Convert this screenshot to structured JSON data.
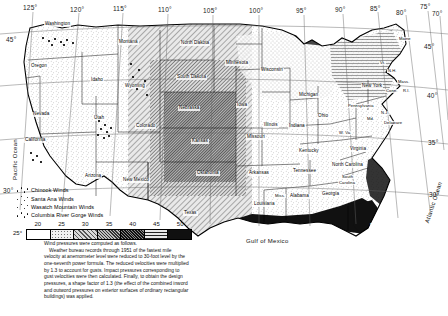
{
  "map": {
    "title": "United States wind pressure map",
    "oceans": [
      {
        "name": "Pacific Ocean",
        "x": 10,
        "y": 175,
        "rot": "vert"
      },
      {
        "name": "Atlantic Ocean",
        "x": 420,
        "y": 215,
        "rot": "vert2"
      },
      {
        "name": "Gulf of Mexico",
        "x": 248,
        "y": 240,
        "rot": "none"
      }
    ],
    "longitude_labels": [
      {
        "label": "125°",
        "x": 23,
        "y": 4
      },
      {
        "label": "120°",
        "x": 70,
        "y": 6
      },
      {
        "label": "115°",
        "x": 113,
        "y": 5
      },
      {
        "label": "110°",
        "x": 158,
        "y": 6
      },
      {
        "label": "105°",
        "x": 203,
        "y": 7
      },
      {
        "label": "100°",
        "x": 249,
        "y": 7
      },
      {
        "label": "95°",
        "x": 296,
        "y": 7
      },
      {
        "label": "90°",
        "x": 335,
        "y": 6
      },
      {
        "label": "85°",
        "x": 370,
        "y": 5
      },
      {
        "label": "80°",
        "x": 398,
        "y": 8
      },
      {
        "label": "75°",
        "x": 423,
        "y": 4
      },
      {
        "label": "70°",
        "x": 437,
        "y": 8
      },
      {
        "label": "65°",
        "x": 428,
        "y": 14
      }
    ],
    "latitude_labels_left": [
      {
        "label": "45°",
        "x": 6,
        "y": 37
      },
      {
        "label": "30°",
        "x": 3,
        "y": 188
      }
    ],
    "latitude_labels_right": [
      {
        "label": "45°",
        "x": 424,
        "y": 44
      },
      {
        "label": "40°",
        "x": 427,
        "y": 93
      },
      {
        "label": "35°",
        "x": 429,
        "y": 140
      },
      {
        "label": "30°",
        "x": 430,
        "y": 192
      }
    ],
    "states": [
      {
        "name": "Washington",
        "x": 44,
        "y": 24,
        "size": "sm"
      },
      {
        "name": "Oregon",
        "x": 30,
        "y": 66,
        "size": "sm"
      },
      {
        "name": "Idaho",
        "x": 90,
        "y": 79,
        "size": "sm"
      },
      {
        "name": "Montana",
        "x": 118,
        "y": 41,
        "size": "sm"
      },
      {
        "name": "Nevada",
        "x": 34,
        "y": 113,
        "size": "sm"
      },
      {
        "name": "Utah",
        "x": 93,
        "y": 118,
        "size": "sm"
      },
      {
        "name": "Wyoming",
        "x": 126,
        "y": 85,
        "size": "sm"
      },
      {
        "name": "California",
        "x": 26,
        "y": 139,
        "size": "sm"
      },
      {
        "name": "Arizona",
        "x": 86,
        "y": 175,
        "size": "sm"
      },
      {
        "name": "Colorado",
        "x": 137,
        "y": 125,
        "size": "sm"
      },
      {
        "name": "New Mexico",
        "x": 124,
        "y": 180,
        "size": "sm"
      },
      {
        "name": "North Dakota",
        "x": 182,
        "y": 42,
        "size": "sm"
      },
      {
        "name": "South Dakota",
        "x": 178,
        "y": 76,
        "size": "sm"
      },
      {
        "name": "Nebraska",
        "x": 180,
        "y": 107,
        "size": "sm"
      },
      {
        "name": "Kansas",
        "x": 193,
        "y": 140,
        "size": "sm"
      },
      {
        "name": "Oklahoma",
        "x": 198,
        "y": 172,
        "size": "sm"
      },
      {
        "name": "Texas",
        "x": 185,
        "y": 212,
        "size": "sm"
      },
      {
        "name": "Minnesota",
        "x": 227,
        "y": 62,
        "size": "sm"
      },
      {
        "name": "Iowa",
        "x": 238,
        "y": 104,
        "size": "sm"
      },
      {
        "name": "Missouri",
        "x": 248,
        "y": 136,
        "size": "sm"
      },
      {
        "name": "Arkansas",
        "x": 250,
        "y": 172,
        "size": "sm"
      },
      {
        "name": "Louisiana",
        "x": 255,
        "y": 203,
        "size": "sm"
      },
      {
        "name": "Wisconsin",
        "x": 262,
        "y": 69,
        "size": "sm"
      },
      {
        "name": "Illinois",
        "x": 265,
        "y": 124,
        "size": "sm"
      },
      {
        "name": "Indiana",
        "x": 290,
        "y": 125,
        "size": "sm"
      },
      {
        "name": "Michigan",
        "x": 300,
        "y": 94,
        "size": "sm"
      },
      {
        "name": "Ohio",
        "x": 318,
        "y": 115,
        "size": "sm"
      },
      {
        "name": "Kentucky",
        "x": 300,
        "y": 150,
        "size": "sm"
      },
      {
        "name": "Tennessee",
        "x": 294,
        "y": 170,
        "size": "sm"
      },
      {
        "name": "Miss.",
        "x": 276,
        "y": 195,
        "size": "tiny"
      },
      {
        "name": "Alabama",
        "x": 291,
        "y": 195,
        "size": "sm"
      },
      {
        "name": "Georgia",
        "x": 323,
        "y": 193,
        "size": "sm"
      },
      {
        "name": "Florida",
        "x": 371,
        "y": 225,
        "size": "sm"
      },
      {
        "name": "South",
        "x": 341,
        "y": 176,
        "size": "tiny"
      },
      {
        "name": "Carolina",
        "x": 338,
        "y": 182,
        "size": "tiny"
      },
      {
        "name": "North Carolina",
        "x": 333,
        "y": 164,
        "size": "sm"
      },
      {
        "name": "Virginia",
        "x": 351,
        "y": 148,
        "size": "sm"
      },
      {
        "name": "W. Va.",
        "x": 340,
        "y": 132,
        "size": "tiny"
      },
      {
        "name": "Pennsylvania",
        "x": 349,
        "y": 105,
        "size": "tiny"
      },
      {
        "name": "New York",
        "x": 363,
        "y": 85,
        "size": "sm"
      },
      {
        "name": "Maine",
        "x": 400,
        "y": 38,
        "size": "tiny"
      },
      {
        "name": "Vt.",
        "x": 381,
        "y": 62,
        "size": "tiny"
      },
      {
        "name": "N.H.",
        "x": 389,
        "y": 70,
        "size": "tiny"
      },
      {
        "name": "Mass.",
        "x": 399,
        "y": 81,
        "size": "tiny"
      },
      {
        "name": "Conn.",
        "x": 387,
        "y": 90,
        "size": "tiny"
      },
      {
        "name": "R.I.",
        "x": 403,
        "y": 90,
        "size": "tiny"
      },
      {
        "name": "N.J.",
        "x": 381,
        "y": 112,
        "size": "tiny"
      },
      {
        "name": "Md.",
        "x": 368,
        "y": 118,
        "size": "tiny"
      },
      {
        "name": "Delaware",
        "x": 385,
        "y": 122,
        "size": "tiny"
      }
    ]
  },
  "wind_legend": {
    "items": [
      {
        "label": "Chinook Winds"
      },
      {
        "label": "Santa Ana Winds"
      },
      {
        "label": "Wasatch Mountain Winds"
      },
      {
        "label": "Columbia River Gorge Winds"
      }
    ]
  },
  "scale_legend": {
    "lat_marker": "25°",
    "ticks": [
      "20",
      "25",
      "30",
      "35",
      "40",
      "45",
      "50"
    ],
    "swatch_classes": [
      "sw-20",
      "sw-25",
      "sw-30",
      "sw-35",
      "sw-40",
      "sw-45",
      "sw-50"
    ]
  },
  "caption": {
    "lead": "Wind pressures were computed as follows.",
    "body": "Weather bureau records through 1951 of the fastest mile velocity at anemometer level were reduced to 30-foot level by the one-seventh power formula. The reduced velocities were multiplied by 1.3 to account for gusts. Impact pressures corresponding to gust velocities were then calculated. Finally, to obtain the design pressures, a shape factor of 1.3 (the effect of the combined inword and outword pressures on exterior surfaces of ordinary rectangular buildings) was applied."
  }
}
